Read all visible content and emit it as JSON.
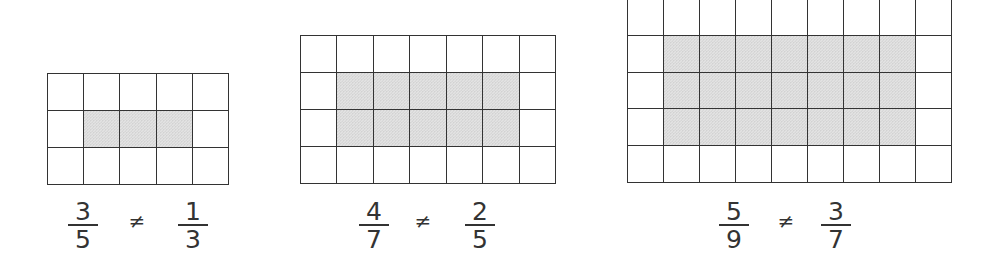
{
  "diagram": {
    "colors": {
      "grid_line": "#333333",
      "shade": "#e3e3e3",
      "background": "#ffffff",
      "text": "#333333"
    },
    "panels": [
      {
        "id": "panel-1",
        "grid": {
          "columns": 5,
          "rows": 3,
          "x": 47,
          "y": 73,
          "width": 181,
          "height": 111,
          "shaded_rows": [
            2
          ],
          "shaded_columns": [
            2,
            3,
            4
          ]
        },
        "label": {
          "left": {
            "numerator": "3",
            "denominator": "5",
            "cx": 83
          },
          "symbol": "≠",
          "symbol_cx": 137,
          "right": {
            "numerator": "1",
            "denominator": "3",
            "cx": 193
          }
        }
      },
      {
        "id": "panel-2",
        "grid": {
          "columns": 7,
          "rows": 4,
          "x": 300,
          "y": 35,
          "width": 255,
          "height": 148,
          "shaded_rows": [
            2,
            3
          ],
          "shaded_columns": [
            2,
            3,
            4,
            5,
            6
          ]
        },
        "label": {
          "left": {
            "numerator": "4",
            "denominator": "7",
            "cx": 374
          },
          "symbol": "≠",
          "symbol_cx": 423,
          "right": {
            "numerator": "2",
            "denominator": "5",
            "cx": 480
          }
        }
      },
      {
        "id": "panel-3",
        "grid": {
          "columns": 9,
          "rows": 5,
          "x": 627,
          "y": -2,
          "width": 324,
          "height": 184,
          "shaded_rows": [
            2,
            3,
            4
          ],
          "shaded_columns": [
            2,
            3,
            4,
            5,
            6,
            7,
            8
          ]
        },
        "label": {
          "left": {
            "numerator": "5",
            "denominator": "9",
            "cx": 734
          },
          "symbol": "≠",
          "symbol_cx": 786,
          "right": {
            "numerator": "3",
            "denominator": "7",
            "cx": 836
          }
        }
      }
    ]
  }
}
